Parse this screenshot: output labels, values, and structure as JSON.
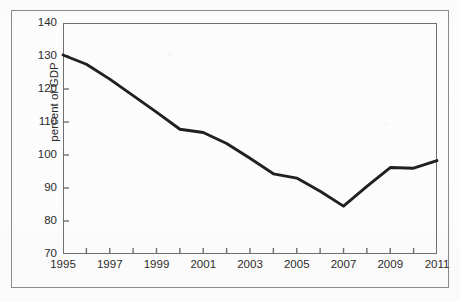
{
  "figure": {
    "frame_color": "#8a8a8a",
    "plot_border_color": "#6f6f6f",
    "line_color": "#231f20",
    "background_color": "#fdfdfd"
  },
  "chart_data": {
    "type": "line",
    "title": "",
    "subtitle": "",
    "xlabel": "",
    "ylabel": "percent of GDP",
    "xlim": [
      1995,
      2011
    ],
    "ylim": [
      70,
      140
    ],
    "grid": false,
    "legend": null,
    "y_ticks": [
      140,
      130,
      120,
      110,
      100,
      90,
      80,
      70
    ],
    "x_ticks": [
      1995,
      1996,
      1997,
      1998,
      1999,
      2000,
      2001,
      2002,
      2003,
      2004,
      2005,
      2006,
      2007,
      2008,
      2009,
      2010,
      2011
    ],
    "x_tick_labels": [
      "1995",
      "",
      "1997",
      "",
      "1999",
      "",
      "2001",
      "",
      "2003",
      "",
      "2005",
      "",
      "2007",
      "",
      "2009",
      "",
      "2011"
    ],
    "x_labeled_ticks": [
      1995,
      1997,
      1999,
      2001,
      2003,
      2005,
      2007,
      2009,
      2011
    ],
    "series": [
      {
        "name": "percent of GDP",
        "color": "#231f20",
        "x": [
          1995,
          1996,
          1997,
          1998,
          1999,
          2000,
          2001,
          2002,
          2003,
          2004,
          2005,
          2006,
          2007,
          2008,
          2009,
          2010,
          2011
        ],
        "values": [
          130.3,
          127.5,
          123.0,
          118.0,
          113.0,
          107.8,
          106.8,
          103.5,
          99.0,
          94.3,
          93.0,
          89.0,
          84.5,
          90.5,
          96.2,
          96.0,
          98.3
        ]
      }
    ]
  }
}
